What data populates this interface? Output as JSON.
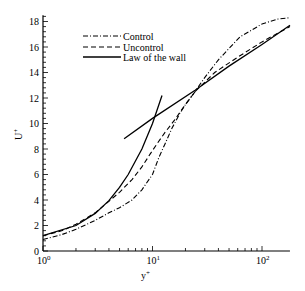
{
  "chart_data": {
    "type": "line",
    "title": "",
    "xlabel": "y+",
    "ylabel": "U+",
    "xscale": "log",
    "xlim": [
      1,
      180
    ],
    "ylim": [
      0,
      18.5
    ],
    "x_ticks": [
      {
        "value": 1,
        "label": "10",
        "exp": "0"
      },
      {
        "value": 10,
        "label": "10",
        "exp": "1"
      },
      {
        "value": 100,
        "label": "10",
        "exp": "2"
      }
    ],
    "y_ticks": [
      0,
      2,
      4,
      6,
      8,
      10,
      12,
      14,
      16,
      18
    ],
    "grid": false,
    "legend_position": "upper-left",
    "series": [
      {
        "name": "Control",
        "style": "dash-dot",
        "x": [
          1,
          1.5,
          2,
          3,
          4,
          5,
          6.5,
          8,
          10,
          11.4,
          13,
          15,
          17.8,
          20,
          24.5,
          30,
          40,
          63,
          100,
          140,
          180
        ],
        "y": [
          0.9,
          1.3,
          1.7,
          2.4,
          3.0,
          3.4,
          4.0,
          4.8,
          6.0,
          7.3,
          8.4,
          9.6,
          10.8,
          11.5,
          12.5,
          13.6,
          15.0,
          16.8,
          17.8,
          18.2,
          18.3
        ]
      },
      {
        "name": "Uncontrol",
        "style": "dashed",
        "x": [
          1,
          1.5,
          2,
          3,
          4,
          5,
          6.5,
          8,
          9.5,
          11,
          13,
          16,
          18.5,
          24.5,
          37,
          60,
          100,
          140,
          180
        ],
        "y": [
          1.2,
          1.6,
          2.1,
          3.0,
          3.9,
          4.6,
          5.6,
          6.6,
          7.6,
          8.4,
          9.3,
          10.3,
          11.1,
          12.5,
          14.0,
          15.2,
          16.4,
          17.1,
          17.6
        ]
      },
      {
        "name": "Law of the wall",
        "style": "solid",
        "segments": [
          {
            "label": "linear sublayer U+=y+",
            "x": [
              1,
              2,
              3,
              4,
              5,
              6,
              8,
              10,
              12.2
            ],
            "y": [
              1.2,
              2.0,
              2.95,
              3.95,
              5.0,
              6.0,
              8.0,
              10.0,
              12.2
            ]
          },
          {
            "label": "log law U+=2.44 ln y+ + 5.0",
            "x": [
              5.5,
              10,
              24.5,
              50,
              100,
              180
            ],
            "y": [
              8.8,
              10.4,
              12.6,
              14.5,
              16.2,
              17.7
            ]
          }
        ]
      }
    ]
  },
  "legend": {
    "items": [
      {
        "label": "Control",
        "style": "dash-dot"
      },
      {
        "label": "Uncontrol",
        "style": "dashed"
      },
      {
        "label": "Law of the wall",
        "style": "solid"
      }
    ]
  },
  "axes": {
    "xlabel_main": "y",
    "xlabel_sup": "+",
    "ylabel_main": "U",
    "ylabel_sup": "+"
  }
}
